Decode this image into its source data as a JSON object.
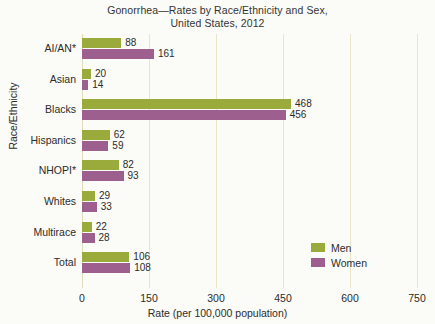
{
  "chart_data": {
    "type": "bar",
    "orientation": "horizontal",
    "title": "Gonorrhea—Rates by Race/Ethnicity and Sex,",
    "subtitle": "United States, 2012",
    "xlabel": "Rate (per 100,000 population)",
    "ylabel": "Race/Ethnicity",
    "categories": [
      "AI/AN*",
      "Asian",
      "Blacks",
      "Hispanics",
      "NHOPI*",
      "Whites",
      "Multirace",
      "Total"
    ],
    "series": [
      {
        "name": "Men",
        "color": "#9aab3c",
        "values": [
          88,
          20,
          468,
          62,
          82,
          29,
          22,
          106
        ]
      },
      {
        "name": "Women",
        "color": "#9d5f8e",
        "values": [
          161,
          14,
          456,
          59,
          93,
          33,
          28,
          108
        ]
      }
    ],
    "xlim": [
      0,
      750
    ],
    "xticks": [
      0,
      150,
      300,
      450,
      600,
      750
    ],
    "xtick_labels": [
      "0",
      "150",
      "300",
      "450",
      "600",
      "750"
    ],
    "grid": "vertical",
    "legend_position": "inside-right-lower"
  },
  "colors": {
    "men": "#9aab3c",
    "women": "#9d5f8e",
    "gridline": "#e9e5c8",
    "background": "#fbfbf7",
    "text": "#2b2b2b"
  }
}
